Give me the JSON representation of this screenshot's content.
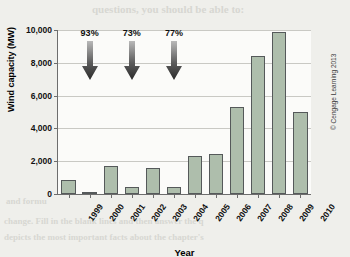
{
  "chart_data": {
    "type": "bar",
    "title": "",
    "xlabel": "Year",
    "ylabel": "Wind capacity (MW)",
    "categories": [
      "1999",
      "2000",
      "2001",
      "2002",
      "2003",
      "2004",
      "2005",
      "2006",
      "2007",
      "2008",
      "2009",
      "2010"
    ],
    "values": [
      850,
      150,
      1700,
      420,
      1600,
      400,
      2300,
      2440,
      5300,
      8400,
      9900,
      5000
    ],
    "ylim": [
      0,
      10000
    ],
    "yticks": [
      0,
      2000,
      4000,
      6000,
      8000,
      10000
    ],
    "ytick_labels": [
      "0",
      "2,000",
      "4,000",
      "6,000",
      "8,000",
      "10,000"
    ],
    "grid": true,
    "legend": "none",
    "bar_color": "#aebeac",
    "bar_edge_color": "#55595a",
    "annotations": [
      {
        "label": "93%",
        "category": "2000",
        "marker": "down-arrow"
      },
      {
        "label": "73%",
        "category": "2002",
        "marker": "down-arrow"
      },
      {
        "label": "77%",
        "category": "2004",
        "marker": "down-arrow"
      }
    ]
  },
  "credit": "© Cengage Learning 2013",
  "ghost_text": {
    "line1": "questions, you should be able to:",
    "line2": "ng the core necessary to a good ans",
    "line3": "to each",
    "line4": "recognize the material in the quest",
    "line5": "in detail",
    "line6": "in the review process",
    "line7": "and formu",
    "line8": "change. Fill in the blank lines and then answer the q",
    "line9": "depicts the most important facts about the chapter's"
  }
}
